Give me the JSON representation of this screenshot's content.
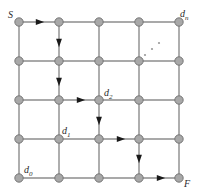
{
  "figure": {
    "type": "grid-graph-diagram",
    "width": 202,
    "height": 195,
    "background_color": "#ffffff",
    "grid": {
      "rows": 5,
      "cols": 5,
      "x_start": 19,
      "y_start": 22,
      "spacing_x": 40,
      "spacing_y": 39,
      "edge_color": "#8c8c8c",
      "edge_width": 1.4,
      "node_radius": 4.2,
      "node_fill": "#a8a8a8",
      "node_stroke": "#6e6e6e"
    },
    "arrow_color": "#1a1a1a",
    "arrows": [
      {
        "name": "arrow-top-right-1",
        "x": 40,
        "y": 22,
        "dir": "right"
      },
      {
        "name": "arrow-down-col1-row1",
        "x": 59,
        "y": 43,
        "dir": "down"
      },
      {
        "name": "arrow-down-col1-row2",
        "x": 59,
        "y": 82,
        "dir": "down"
      },
      {
        "name": "arrow-right-into-d2",
        "x": 81,
        "y": 100,
        "dir": "right"
      },
      {
        "name": "arrow-down-col2-row3",
        "x": 99,
        "y": 121,
        "dir": "down"
      },
      {
        "name": "arrow-right-row3",
        "x": 121,
        "y": 139,
        "dir": "right"
      },
      {
        "name": "arrow-down-col3-row4",
        "x": 139,
        "y": 159,
        "dir": "down"
      },
      {
        "name": "arrow-right-into-F",
        "x": 161,
        "y": 178,
        "dir": "right"
      }
    ],
    "ellipsis": {
      "name": "diagonal-ellipsis",
      "dots": [
        {
          "x": 145,
          "y": 55
        },
        {
          "x": 152,
          "y": 49
        },
        {
          "x": 159,
          "y": 43
        }
      ],
      "color": "#9a9a9a",
      "radius": 1.1
    },
    "labels": [
      {
        "name": "node-label-start",
        "text": "S",
        "sub": "",
        "x": 8,
        "y": 10
      },
      {
        "name": "node-label-dn",
        "text": "d",
        "sub": "n",
        "x": 180,
        "y": 9
      },
      {
        "name": "node-label-d2",
        "text": "d",
        "sub": "2",
        "x": 104,
        "y": 88
      },
      {
        "name": "node-label-d1",
        "text": "d",
        "sub": "1",
        "x": 62,
        "y": 126
      },
      {
        "name": "node-label-d0",
        "text": "d",
        "sub": "0",
        "x": 24,
        "y": 165
      },
      {
        "name": "node-label-finish",
        "text": "F",
        "sub": "",
        "x": 184,
        "y": 179
      }
    ]
  }
}
